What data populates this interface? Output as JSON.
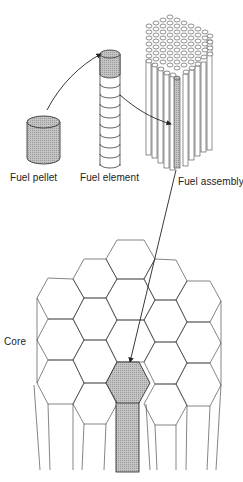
{
  "diagram": {
    "labels": {
      "pellet": "Fuel pellet",
      "element": "Fuel element",
      "assembly": "Fuel assembly",
      "core": "Core"
    },
    "colors": {
      "line": "#222222",
      "shade": "#b8b8b8",
      "background": "#ffffff"
    },
    "flow": [
      "Fuel pellet",
      "Fuel element",
      "Fuel assembly",
      "Core"
    ]
  }
}
